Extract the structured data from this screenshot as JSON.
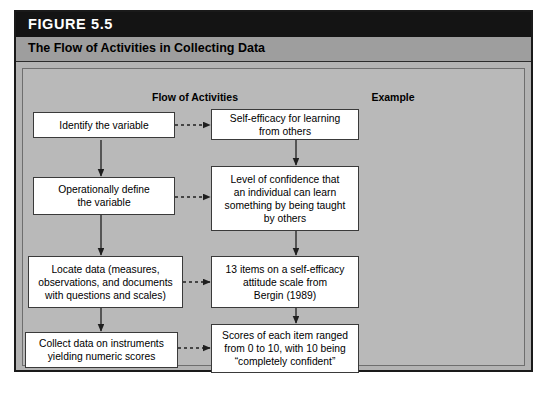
{
  "figure": {
    "label": "FIGURE 5.5",
    "subtitle": "The Flow of Activities in Collecting Data"
  },
  "columns": {
    "left_header": "Flow of Activities",
    "right_header": "Example"
  },
  "flow_steps": [
    {
      "id": "step-1",
      "text": "Identify the variable"
    },
    {
      "id": "step-2",
      "text": "Operationally define\nthe variable"
    },
    {
      "id": "step-3",
      "text": "Locate data (measures,\nobservations, and documents\nwith questions and scales)"
    },
    {
      "id": "step-4",
      "text": "Collect data on instruments\nyielding numeric scores"
    }
  ],
  "examples": [
    {
      "id": "example-1",
      "text": "Self-efficacy for learning\nfrom others"
    },
    {
      "id": "example-2",
      "text": "Level of confidence that\nan individual can learn\nsomething by being taught\nby others"
    },
    {
      "id": "example-3",
      "text": "13 items on a self-efficacy\nattitude scale from\nBergin (1989)"
    },
    {
      "id": "example-4",
      "text": "Scores of each item ranged\nfrom 0 to 10, with 10 being\n“completely confident”"
    }
  ],
  "colors": {
    "title_bar": "#141414",
    "subtitle_bar": "#9e9e9e",
    "panel_background": "#b9b9b9",
    "box_fill": "#ffffff",
    "box_border": "#3a3a3a",
    "connector": "#1f1f1f"
  }
}
